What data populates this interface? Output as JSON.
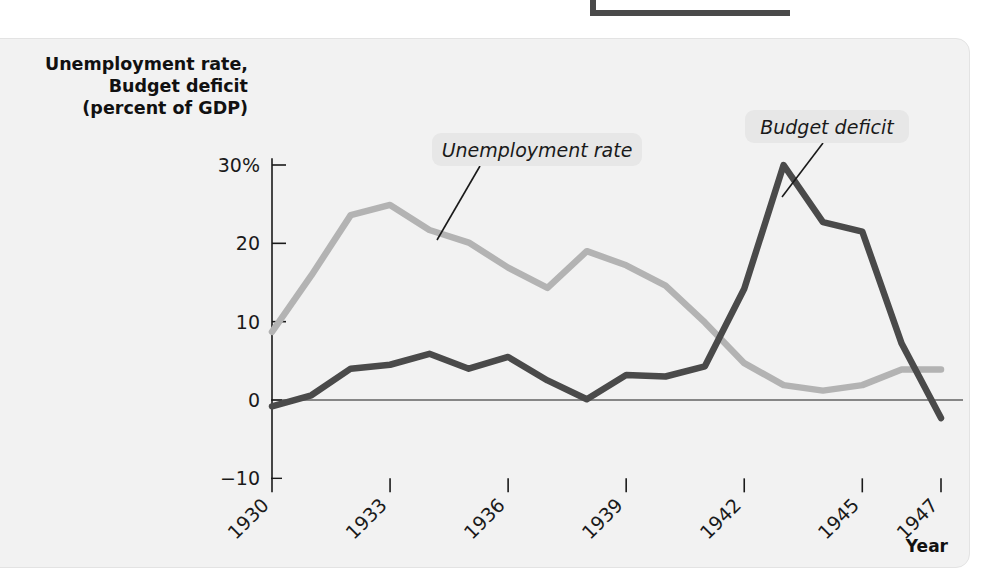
{
  "figure": {
    "y_axis_title_lines": [
      "Unemployment rate,",
      "Budget deficit",
      "(percent of GDP)"
    ],
    "x_axis_title": "Year"
  },
  "chart_data": {
    "type": "line",
    "title": "",
    "xlabel": "Year",
    "ylabel": "Unemployment rate, Budget deficit (percent of GDP)",
    "x": [
      1930,
      1931,
      1932,
      1933,
      1934,
      1935,
      1936,
      1937,
      1938,
      1939,
      1940,
      1941,
      1942,
      1943,
      1944,
      1945,
      1946,
      1947
    ],
    "xlim": [
      1930,
      1947
    ],
    "ylim": [
      -10,
      32
    ],
    "xticks": [
      1930,
      1933,
      1936,
      1939,
      1942,
      1945,
      1947
    ],
    "xtick_labels": [
      "1930",
      "1933",
      "1936",
      "1939",
      "1942",
      "1945",
      "1947"
    ],
    "yticks": [
      -10,
      0,
      10,
      20,
      30
    ],
    "ytick_labels": [
      "−10",
      "0",
      "10",
      "20",
      "30%"
    ],
    "grid": false,
    "legend_position": "inline-annotations",
    "zero_line": true,
    "series": [
      {
        "name": "Unemployment rate",
        "color": "#b3b3b3",
        "values": [
          8.7,
          15.9,
          23.6,
          24.9,
          21.7,
          20.1,
          16.9,
          14.3,
          19.0,
          17.2,
          14.6,
          9.9,
          4.7,
          1.9,
          1.2,
          1.9,
          3.9,
          3.9
        ]
      },
      {
        "name": "Budget deficit",
        "color": "#4a4a4a",
        "values": [
          -0.8,
          0.6,
          4.0,
          4.5,
          5.9,
          4.0,
          5.5,
          2.5,
          0.1,
          3.2,
          3.0,
          4.3,
          14.2,
          30.0,
          22.7,
          21.5,
          7.2,
          -2.3
        ]
      }
    ],
    "annotations": [
      {
        "text": "Unemployment rate",
        "series": "Unemployment rate",
        "chip_x": 432,
        "chip_y": 133,
        "chip_w": 210,
        "chip_h": 33,
        "leader_from_x": 480,
        "leader_from_y": 166,
        "leader_to_x": 437,
        "leader_to_y": 240
      },
      {
        "text": "Budget deficit",
        "series": "Budget deficit",
        "chip_x": 745,
        "chip_y": 110,
        "chip_w": 164,
        "chip_h": 33,
        "leader_from_x": 823,
        "leader_from_y": 143,
        "leader_to_x": 782,
        "leader_to_y": 197
      }
    ]
  }
}
